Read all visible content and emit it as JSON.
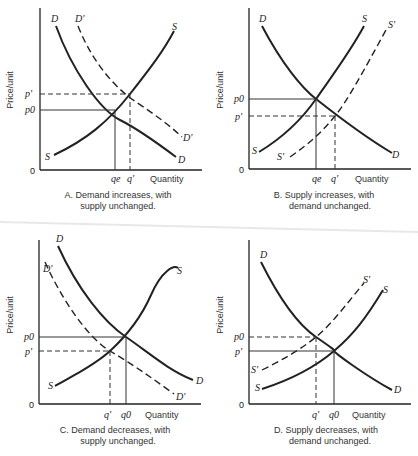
{
  "axis_labels": {
    "y": "Price/unit",
    "x": "Quantity",
    "origin": "0"
  },
  "panels": [
    {
      "id": "A",
      "caption_line1": "A. Demand increases, with",
      "caption_line2": "supply unchanged.",
      "curves": {
        "D": "D",
        "D_prime": "D'",
        "S": "S"
      },
      "price_ticks": {
        "upper": "p'",
        "lower": "p0"
      },
      "qty_ticks": {
        "left": "qe",
        "right": "q'"
      }
    },
    {
      "id": "B",
      "caption_line1": "B. Supply increases, with",
      "caption_line2": "demand unchanged.",
      "curves": {
        "D": "D",
        "S": "S",
        "S_prime": "S'"
      },
      "price_ticks": {
        "upper": "p0",
        "lower": "p'"
      },
      "qty_ticks": {
        "left": "qe",
        "right": "q'"
      }
    },
    {
      "id": "C",
      "caption_line1": "C. Demand decreases, with",
      "caption_line2": "supply unchanged.",
      "curves": {
        "D": "D",
        "D_prime": "D'",
        "S": "S"
      },
      "price_ticks": {
        "upper": "p0",
        "lower": "p'"
      },
      "qty_ticks": {
        "left": "q'",
        "right": "q0"
      }
    },
    {
      "id": "D",
      "caption_line1": "D. Supply decreases, with",
      "caption_line2": "demand unchanged.",
      "curves": {
        "D": "D",
        "S": "S",
        "S_prime": "S'"
      },
      "price_ticks": {
        "upper": "p0",
        "lower": "p'"
      },
      "qty_ticks": {
        "left": "q'",
        "right": "q0"
      }
    }
  ]
}
